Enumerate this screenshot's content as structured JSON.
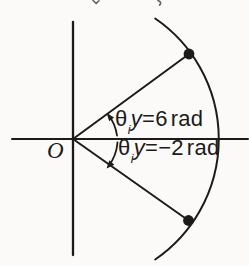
{
  "figure": {
    "origin_label": "O",
    "labels": {
      "upper": {
        "theta": "θ",
        "sub": "i",
        "var": "y",
        "eq": "=",
        "value": "6",
        "unit": "rad"
      },
      "lower": {
        "theta": "θ",
        "sub": "i",
        "var": "y",
        "eq": "=",
        "value": "−2",
        "unit": "rad"
      }
    },
    "colors": {
      "ink": "#1b1b1b",
      "paper": "#fbfaf8"
    }
  }
}
